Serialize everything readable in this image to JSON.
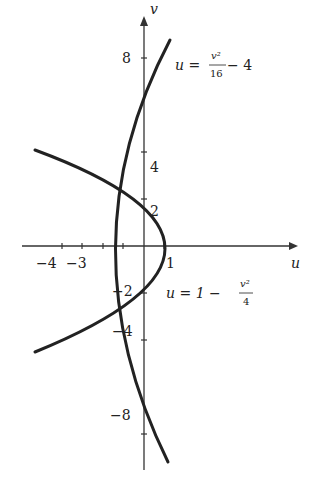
{
  "figure": {
    "axes": {
      "x_label": "u",
      "y_label": "v",
      "x_ticks": [
        {
          "value": -4,
          "label": "−4"
        },
        {
          "value": -3,
          "label": "−3"
        },
        {
          "value": 1,
          "label": "1"
        }
      ],
      "y_ticks": [
        {
          "value": 8,
          "label": "8"
        },
        {
          "value": 4,
          "label": "4"
        },
        {
          "value": 2,
          "label": "2"
        },
        {
          "value": -2,
          "label": "−2"
        },
        {
          "value": -4,
          "label": "−4"
        },
        {
          "value": -8,
          "label": "−8"
        }
      ]
    },
    "curves": [
      {
        "name": "parabola-1",
        "label_lhs": "u = ",
        "label_num": "v²",
        "label_den": "16",
        "label_rhs": " − 4",
        "equation": "u = v^2/16 - 4"
      },
      {
        "name": "parabola-2",
        "label_lhs": "u = 1 − ",
        "label_num": "v²",
        "label_den": "4",
        "label_rhs": "",
        "equation": "u = 1 - v^2/4"
      }
    ],
    "colors": {
      "curve": "#222222",
      "axis": "#333333",
      "background": "#ffffff"
    }
  }
}
